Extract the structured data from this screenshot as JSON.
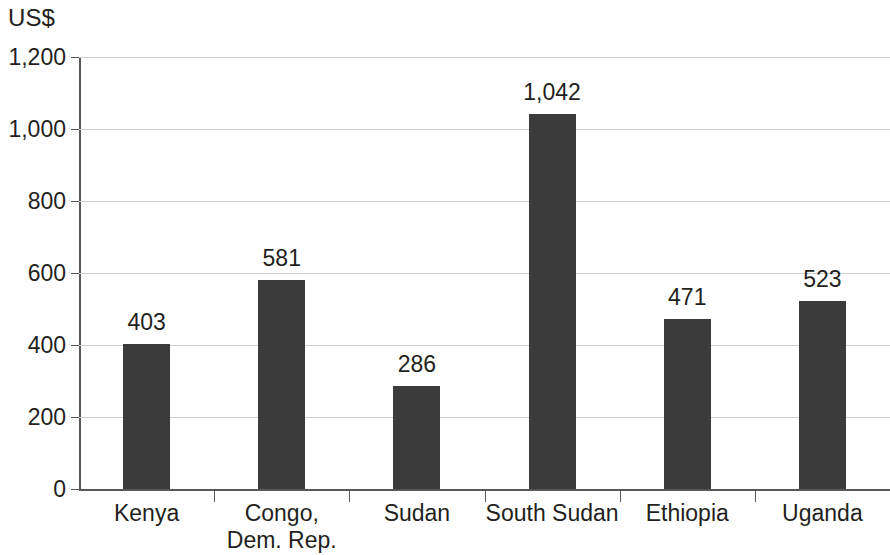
{
  "chart_data": {
    "type": "bar",
    "title": "",
    "subtitle": "",
    "xlabel": "",
    "ylabel": "US$",
    "unit_label": "US$",
    "categories": [
      "Kenya",
      "Congo, Dem. Rep.",
      "Sudan",
      "South Sudan",
      "Ethiopia",
      "Uganda"
    ],
    "category_lines": [
      [
        "Kenya"
      ],
      [
        "Congo,",
        "Dem. Rep."
      ],
      [
        "Sudan"
      ],
      [
        "South Sudan"
      ],
      [
        "Ethiopia"
      ],
      [
        "Uganda"
      ]
    ],
    "values": [
      403,
      581,
      286,
      1042,
      471,
      523
    ],
    "value_labels": [
      "403",
      "581",
      "286",
      "1,042",
      "471",
      "523"
    ],
    "ylim": [
      0,
      1200
    ],
    "y_ticks": [
      0,
      200,
      400,
      600,
      800,
      1000,
      1200
    ],
    "y_tick_labels": [
      "0",
      "200",
      "400",
      "600",
      "800",
      "1,000",
      "1,200"
    ],
    "grid": true,
    "grid_axis": "y",
    "legend": false,
    "legend_position": "none",
    "series": [
      {
        "name": "",
        "values": [
          403,
          581,
          286,
          1042,
          471,
          523
        ]
      }
    ],
    "colors": {
      "bar": "#3b3b3b",
      "gridline": "#cfcfcf",
      "axis": "#56595c",
      "text": "#231f20",
      "background": "#ffffff"
    }
  }
}
